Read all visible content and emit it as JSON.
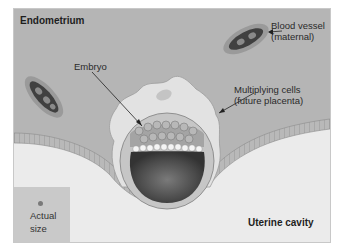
{
  "diagram": {
    "title_region_top": "Endometrium",
    "title_region_bottom": "Uterine cavity",
    "labels": {
      "embryo": "Embryo",
      "blood_vessel_line1": "Blood vessel",
      "blood_vessel_line2": "(maternal)",
      "multiplying_line1": "Multiplying cells",
      "multiplying_line2": "(future placenta)"
    },
    "scale_box": {
      "line1": "Actual",
      "line2": "size"
    },
    "colors": {
      "endometrium": "#b5b5b5",
      "uterine_cavity": "#ebebeb",
      "epithelium": "#a9a9a9",
      "trophoblast": "#e2e2e2",
      "blastocoel": "#4a4a4a",
      "vessel_outer": "#8d8d8d",
      "vessel_inner": "#3e3e3e"
    }
  }
}
